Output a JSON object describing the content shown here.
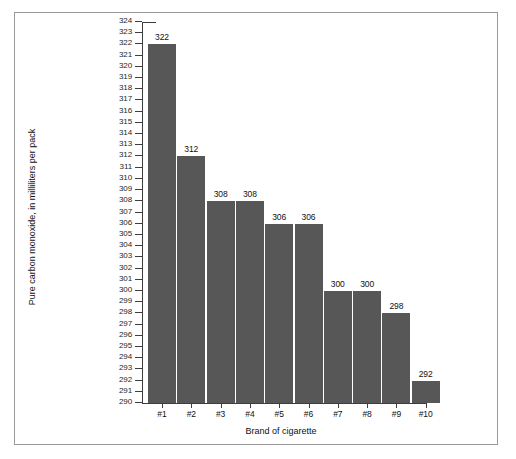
{
  "figure": {
    "background_color": "#ffffff",
    "frame_color": "#9a9a9a",
    "bar_color": "#575757",
    "axis_color": "#3d3d3d"
  },
  "chart_data": {
    "type": "bar",
    "title": "",
    "xlabel": "Brand of cigarette",
    "ylabel": "Pure carbon monoxide, in milliliters per pack",
    "categories": [
      "#1",
      "#2",
      "#3",
      "#4",
      "#5",
      "#6",
      "#7",
      "#8",
      "#9",
      "#10"
    ],
    "values": [
      322,
      312,
      308,
      308,
      306,
      306,
      300,
      300,
      298,
      292
    ],
    "value_labels": [
      "322",
      "312",
      "308",
      "308",
      "306",
      "306",
      "300",
      "300",
      "298",
      "292"
    ],
    "ylim": [
      290,
      324
    ],
    "ytick_step": 1,
    "yticks": [
      324,
      323,
      322,
      321,
      320,
      319,
      318,
      317,
      316,
      315,
      314,
      313,
      312,
      311,
      310,
      309,
      308,
      307,
      306,
      305,
      304,
      303,
      302,
      301,
      300,
      299,
      298,
      297,
      296,
      295,
      294,
      293,
      292,
      291,
      290
    ],
    "grid": false,
    "legend": null,
    "legend_position": "none"
  }
}
